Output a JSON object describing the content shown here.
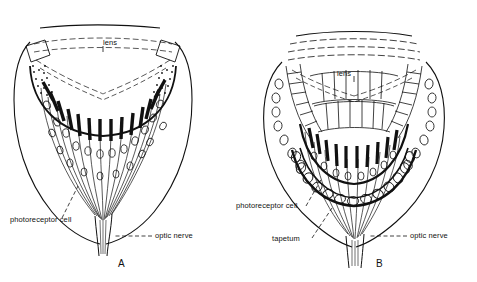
{
  "figure": {
    "title": "",
    "background_color": "#ffffff",
    "ink_color": "#111111"
  },
  "panels": [
    {
      "id": "A",
      "letter": "A",
      "labels": {
        "lens": "lens",
        "photoreceptor_cell": "photoreceptor cell",
        "optic_nerve": "optic nerve"
      }
    },
    {
      "id": "B",
      "letter": "B",
      "labels": {
        "lens": "lens",
        "photoreceptor_cell": "photoreceptor cell",
        "tapetum": "tapetum",
        "optic_nerve": "optic nerve"
      }
    }
  ]
}
